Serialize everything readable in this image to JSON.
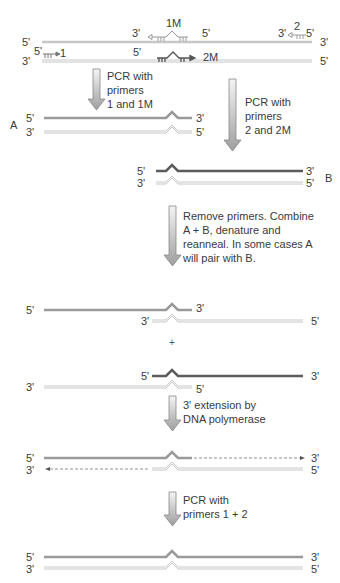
{
  "diagram": {
    "top_caption": "",
    "template": {
      "top_strand": {
        "left": "5'",
        "right": "3'"
      },
      "bottom_strand": {
        "left": "3'",
        "right": "5'"
      },
      "primers": {
        "p1": {
          "name": "1",
          "end": "5'"
        },
        "p1M": {
          "name": "1M",
          "left_end": "3'",
          "right_end": "5'"
        },
        "p2": {
          "name": "2",
          "left_end": "3'",
          "right_end": "5'"
        },
        "p2M": {
          "name": "2M",
          "end": "5'"
        }
      }
    },
    "steps": [
      {
        "id": "pcr-1-1M",
        "text": "PCR with\nprimers\n1 and 1M"
      },
      {
        "id": "pcr-2-2M",
        "text": "PCR with\nprimers\n2 and 2M"
      },
      {
        "id": "combine",
        "text": "Remove primers. Combine\nA + B, denature and\nreanneal. In some cases A\nwill pair with B."
      },
      {
        "id": "extension",
        "text": "3' extension by\nDNA polymerase"
      },
      {
        "id": "pcr-final",
        "text": "PCR with\nprimers 1 + 2"
      }
    ],
    "products": {
      "A": {
        "label": "A",
        "top_left": "5'",
        "top_right": "3'",
        "bottom_left": "3'",
        "bottom_right": "5'"
      },
      "B": {
        "label": "B",
        "top_left": "5'",
        "top_right": "3'",
        "bottom_left": "3'",
        "bottom_right": "5'"
      }
    },
    "hybrid1": {
      "top_left": "5'",
      "top_right": "3'",
      "bottom_left": "3'",
      "bottom_right": "5'"
    },
    "plus": "+",
    "hybrid2": {
      "top_left": "5'",
      "top_right": "3'",
      "bottom_left": "3'",
      "bottom_right": "5'"
    },
    "extended": {
      "top_left": "5'",
      "top_right": "3'",
      "bottom_left": "3'",
      "bottom_right": "5'"
    },
    "final": {
      "top_left": "5'",
      "top_right": "3'",
      "bottom_left": "3'",
      "bottom_right": "5'"
    },
    "colors": {
      "strand_medium": "#9a9a9a",
      "strand_dark": "#5c5c5c",
      "strand_light_outline": "#c8c8c8",
      "arrow_fill": "#b5b5b5",
      "arrow_outline": "#888888"
    }
  }
}
